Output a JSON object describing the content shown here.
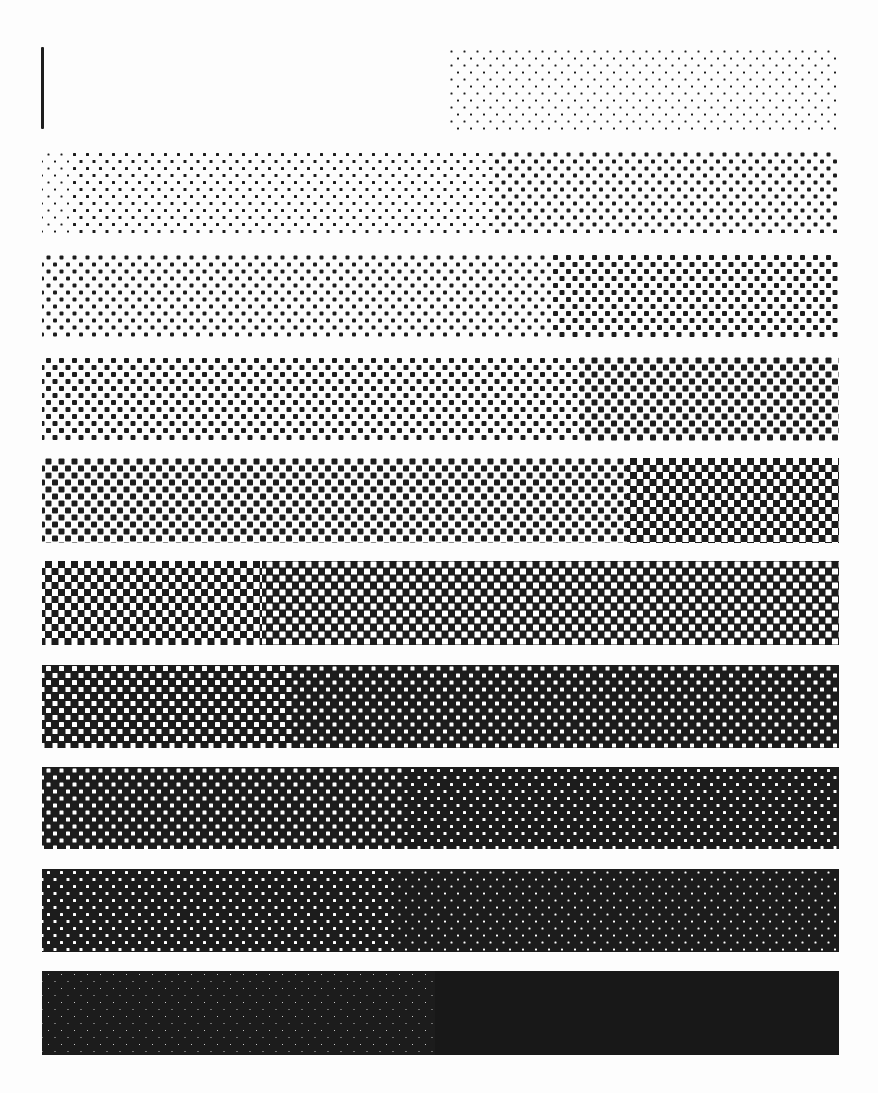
{
  "sheet": {
    "title": "Halftone tone-step test pattern",
    "background": "#ffffff",
    "ink": "#1c1c1c",
    "band_left": 42,
    "band_width": 797,
    "marker_bar": {
      "x": 41,
      "y": 47,
      "width": 3,
      "height": 82
    }
  },
  "bands": [
    {
      "id": 1,
      "top": 48,
      "height": 82,
      "segments": [
        {
          "from": 0,
          "to": 408,
          "tone": 0.0,
          "style": "blank"
        },
        {
          "from": 408,
          "to": 797,
          "tone": 0.06,
          "style": "dots",
          "dot": 2
        }
      ]
    },
    {
      "id": 2,
      "top": 151,
      "height": 82,
      "segments": [
        {
          "from": 0,
          "to": 30,
          "tone": 0.08,
          "style": "dots",
          "dot": 2
        },
        {
          "from": 30,
          "to": 450,
          "tone": 0.14,
          "style": "dots",
          "dot": 3
        },
        {
          "from": 450,
          "to": 797,
          "tone": 0.2,
          "style": "dots",
          "dot": 4
        }
      ]
    },
    {
      "id": 3,
      "top": 254,
      "height": 84,
      "segments": [
        {
          "from": 0,
          "to": 30,
          "tone": 0.22,
          "style": "dots",
          "dot": 4
        },
        {
          "from": 30,
          "to": 510,
          "tone": 0.27,
          "style": "dots",
          "dot": 4
        },
        {
          "from": 510,
          "to": 797,
          "tone": 0.32,
          "style": "dots",
          "dot": 5
        }
      ]
    },
    {
      "id": 4,
      "top": 357,
      "height": 84,
      "segments": [
        {
          "from": 0,
          "to": 538,
          "tone": 0.36,
          "style": "dots",
          "dot": 5
        },
        {
          "from": 538,
          "to": 797,
          "tone": 0.42,
          "style": "dots",
          "dot": 6
        }
      ]
    },
    {
      "id": 5,
      "top": 458,
      "height": 85,
      "segments": [
        {
          "from": 0,
          "to": 170,
          "tone": 0.44,
          "style": "dots",
          "dot": 6
        },
        {
          "from": 170,
          "to": 585,
          "tone": 0.48,
          "style": "dots",
          "dot": 6
        },
        {
          "from": 585,
          "to": 797,
          "tone": 0.52,
          "style": "checker",
          "dot": 7
        }
      ]
    },
    {
      "id": 6,
      "top": 561,
      "height": 84,
      "segments": [
        {
          "from": 0,
          "to": 220,
          "tone": 0.54,
          "style": "checker",
          "dot": 7
        },
        {
          "from": 220,
          "to": 797,
          "tone": 0.6,
          "style": "holes",
          "dot": 6
        }
      ]
    },
    {
      "id": 7,
      "top": 665,
      "height": 83,
      "segments": [
        {
          "from": 0,
          "to": 250,
          "tone": 0.66,
          "style": "holes",
          "dot": 5
        },
        {
          "from": 250,
          "to": 797,
          "tone": 0.7,
          "style": "holes",
          "dot": 4
        }
      ]
    },
    {
      "id": 8,
      "top": 767,
      "height": 82,
      "segments": [
        {
          "from": 0,
          "to": 360,
          "tone": 0.74,
          "style": "holes",
          "dot": 4
        },
        {
          "from": 360,
          "to": 797,
          "tone": 0.78,
          "style": "holes",
          "dot": 3
        }
      ]
    },
    {
      "id": 9,
      "top": 869,
      "height": 83,
      "segments": [
        {
          "from": 0,
          "to": 351,
          "tone": 0.84,
          "style": "holes",
          "dot": 3
        },
        {
          "from": 351,
          "to": 797,
          "tone": 0.89,
          "style": "holes",
          "dot": 2
        }
      ]
    },
    {
      "id": 10,
      "top": 971,
      "height": 84,
      "segments": [
        {
          "from": 0,
          "to": 393,
          "tone": 0.93,
          "style": "holes",
          "dot": 1
        },
        {
          "from": 393,
          "to": 797,
          "tone": 0.97,
          "style": "solid"
        }
      ]
    }
  ],
  "lattice": {
    "pitch_x": 13,
    "pitch_y": 7,
    "row_offset": 6.5
  }
}
